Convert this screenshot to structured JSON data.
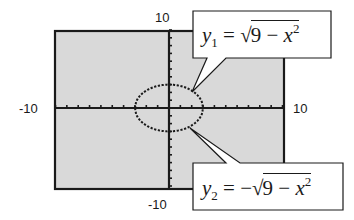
{
  "window": {
    "xmin": "-10",
    "xmax": "10",
    "ymin": "-10",
    "ymax": "10"
  },
  "callouts": {
    "upper": {
      "lhs_var": "y",
      "lhs_sub": "1",
      "eq": "=",
      "neg": "",
      "radicand_a": "9",
      "minus": "−",
      "radicand_var": "x",
      "radicand_exp": "2"
    },
    "lower": {
      "lhs_var": "y",
      "lhs_sub": "2",
      "eq": "=",
      "neg": "−",
      "radicand_a": "9",
      "minus": "−",
      "radicand_var": "x",
      "radicand_exp": "2"
    }
  },
  "colors": {
    "screen_bg": "#d9d9d9",
    "ink": "#1a1a1a",
    "page_bg": "#ffffff"
  },
  "chart_data": {
    "type": "line",
    "title": "",
    "xlabel": "",
    "ylabel": "",
    "xlim": [
      -10,
      10
    ],
    "ylim": [
      -10,
      10
    ],
    "grid": false,
    "tick_labels": {
      "x": [
        "-10",
        "10"
      ],
      "y": [
        "-10",
        "10"
      ]
    },
    "ticks_step": 1,
    "series": [
      {
        "name": "y1 = sqrt(9 - x^2)",
        "style": "dotted",
        "domain": [
          -3,
          3
        ],
        "x": [
          -3,
          -2,
          -1,
          0,
          1,
          2,
          3
        ],
        "values": [
          0,
          2.236,
          2.828,
          3,
          2.828,
          2.236,
          0
        ]
      },
      {
        "name": "y2 = -sqrt(9 - x^2)",
        "style": "dotted",
        "domain": [
          -3,
          3
        ],
        "x": [
          -3,
          -2,
          -1,
          0,
          1,
          2,
          3
        ],
        "values": [
          0,
          -2.236,
          -2.828,
          -3,
          -2.828,
          -2.236,
          0
        ]
      }
    ],
    "annotations": [
      "y1 = sqrt(9 - x^2)",
      "y2 = -sqrt(9 - x^2)"
    ],
    "note": "Graphing-calculator screen with non-square window; circle of radius 3 appears as an ellipse."
  }
}
